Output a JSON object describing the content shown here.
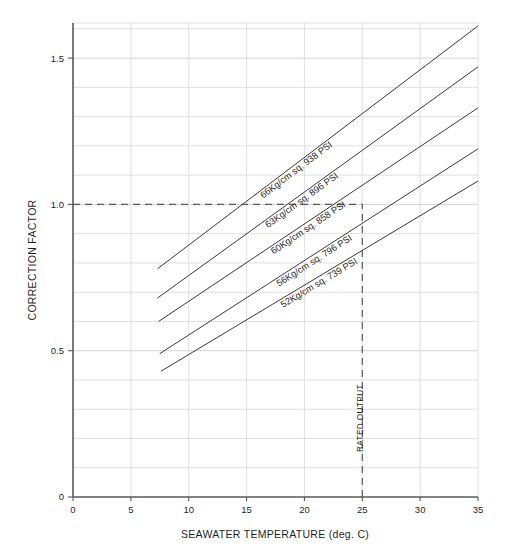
{
  "chart_data": {
    "type": "line",
    "title": "",
    "xlabel": "SEAWATER TEMPERATURE (deg. C)",
    "ylabel": "CORRECTION FACTOR",
    "xlim": [
      0,
      35
    ],
    "ylim": [
      0,
      1.62
    ],
    "grid": true,
    "legend_position": "inline-labels",
    "xticks": [
      "0",
      "5",
      "10",
      "15",
      "20",
      "25",
      "30",
      "35"
    ],
    "xtick_values": [
      0,
      5,
      10,
      15,
      20,
      25,
      30,
      35
    ],
    "yticks": [
      "0",
      "0.5",
      "1.0",
      "1.5"
    ],
    "ytick_values": [
      0,
      0.5,
      1.0,
      1.5
    ],
    "x_gridline_step": 5,
    "y_gridline_step": 0.1,
    "series": [
      {
        "name": "66Kg/cm sq. 938 PSI",
        "label": "66Kg/cm sq. 938 PSI",
        "pressure_kg_cm2": 66,
        "pressure_psi": 938,
        "x": [
          7.3,
          35
        ],
        "values": [
          0.78,
          1.61
        ]
      },
      {
        "name": "63Kg/cm sq. 896 PSI",
        "label": "63Kg/cm sq. 896 PSI",
        "pressure_kg_cm2": 63,
        "pressure_psi": 896,
        "x": [
          7.3,
          35
        ],
        "values": [
          0.68,
          1.47
        ]
      },
      {
        "name": "60Kg/cm sq. 858 PSI",
        "label": "60Kg/cm sq. 858 PSI",
        "pressure_kg_cm2": 60,
        "pressure_psi": 858,
        "x": [
          7.4,
          35
        ],
        "values": [
          0.6,
          1.33
        ]
      },
      {
        "name": "56Kg/cm sq. 796 PSI",
        "label": "56Kg/cm sq. 796 PSI",
        "pressure_kg_cm2": 56,
        "pressure_psi": 796,
        "x": [
          7.5,
          35
        ],
        "values": [
          0.49,
          1.19
        ]
      },
      {
        "name": "52Kg/cm sq. 739 PSI",
        "label": "52Kg/cm sq. 739 PSI",
        "pressure_kg_cm2": 52,
        "pressure_psi": 739,
        "x": [
          7.6,
          35
        ],
        "values": [
          0.43,
          1.08
        ]
      }
    ],
    "annotations": [
      {
        "name": "rated-output",
        "label": "RATED OUTPUT",
        "type": "vertical-dashed-line",
        "x": 25,
        "y_from": 0,
        "y_to": 1.0
      },
      {
        "name": "correction-factor-unity",
        "label": "",
        "type": "horizontal-dashed-line",
        "y": 1.0,
        "x_from": 0,
        "x_to": 25
      }
    ],
    "colors": {
      "curve": "#3a3a3a",
      "grid": "#d8d8d8",
      "axis": "#595959",
      "dashed": "#5a5a5a",
      "background": "#ffffff"
    }
  }
}
